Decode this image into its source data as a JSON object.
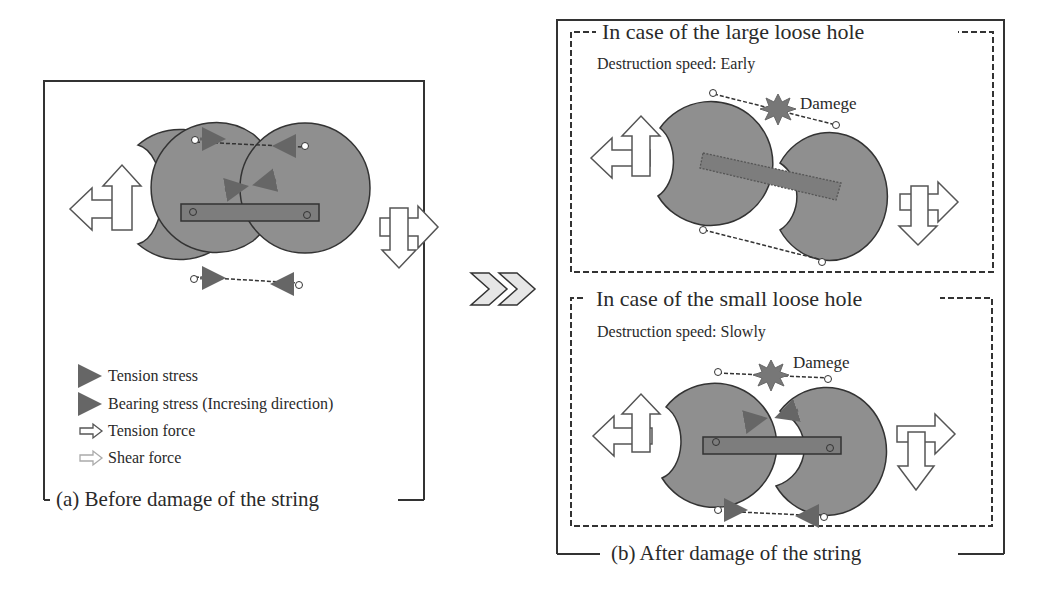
{
  "panel_a": {
    "caption": "(a) Before damage of the string",
    "legend": [
      {
        "icon": "solid-arrow-dark",
        "label": "Tension stress"
      },
      {
        "icon": "solid-arrow-dark",
        "label": "Bearing stress (Incresing direction)"
      },
      {
        "icon": "hollow-arrow",
        "label": "Tension force"
      },
      {
        "icon": "hollow-arrow-light",
        "label": "Shear force"
      }
    ]
  },
  "transition": {
    "icon": "double-chevron-right"
  },
  "panel_b": {
    "caption": "(b) After damage of the string",
    "large_hole": {
      "title": "In case of the large loose hole",
      "speed": "Destruction speed: Early",
      "damage_label": "Damege"
    },
    "small_hole": {
      "title": "In case of the small loose hole",
      "speed": "Destruction speed: Slowly",
      "damage_label": "Damege"
    }
  },
  "colors": {
    "disc_fill": "#8f8f8f",
    "outline": "#333333",
    "stress_arrow": "#666666",
    "background": "#ffffff"
  }
}
